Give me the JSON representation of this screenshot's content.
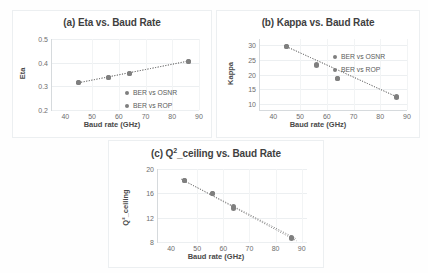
{
  "figure": {
    "background": "#ffffff",
    "marker_color": "#7f7f7f",
    "grid_color": "#eceff1",
    "axis_color": "#d6dadd"
  },
  "legend": {
    "series1": "BER vs OSNR",
    "series2": "BER vs ROP"
  },
  "chart_data": [
    {
      "type": "scatter",
      "panel": "a",
      "title": "(a) Eta vs. Baud Rate",
      "xlabel": "Baud rate (GHz)",
      "ylabel": "Eta",
      "xlim": [
        35,
        90
      ],
      "ylim": [
        0.2,
        0.5
      ],
      "xticks": [
        40,
        50,
        60,
        70,
        80,
        90
      ],
      "yticks": [
        0.2,
        0.3,
        0.4,
        0.5
      ],
      "ytick_labels": [
        "0.2",
        "0.3",
        "0.4",
        "0.5"
      ],
      "xtick_labels": [
        "40",
        "50",
        "60",
        "70",
        "80",
        "90"
      ],
      "grid": true,
      "legend_position": "lower-right",
      "x": [
        45,
        56,
        64,
        86
      ],
      "series": [
        {
          "name": "BER vs OSNR",
          "values": [
            0.315,
            0.337,
            0.355,
            0.405
          ]
        },
        {
          "name": "BER vs ROP",
          "values": [
            0.315,
            0.337,
            0.355,
            0.405
          ]
        }
      ],
      "trendlines": [
        {
          "name": "BER vs OSNR",
          "x0": 44,
          "y0": 0.313,
          "x1": 87,
          "y1": 0.409
        },
        {
          "name": "BER vs ROP",
          "x0": 44,
          "y0": 0.313,
          "x1": 87,
          "y1": 0.409
        }
      ]
    },
    {
      "type": "scatter",
      "panel": "b",
      "title": "(b) Kappa vs. Baud Rate",
      "xlabel": "Baud rate (GHz)",
      "ylabel": "Kappa",
      "xlim": [
        35,
        90
      ],
      "ylim": [
        8,
        32
      ],
      "xticks": [
        40,
        50,
        60,
        70,
        80,
        90
      ],
      "yticks": [
        10,
        15,
        20,
        25,
        30
      ],
      "ytick_labels": [
        "10",
        "15",
        "20",
        "25",
        "30"
      ],
      "xtick_labels": [
        "40",
        "50",
        "60",
        "70",
        "80",
        "90"
      ],
      "grid": true,
      "legend_position": "upper-right",
      "x": [
        45,
        56,
        64,
        86
      ],
      "series": [
        {
          "name": "BER vs OSNR",
          "values": [
            29.6,
            23.3,
            18.8,
            12.4
          ]
        },
        {
          "name": "BER vs ROP",
          "values": [
            29.6,
            23.2,
            18.8,
            12.3
          ]
        }
      ],
      "trendlines": [
        {
          "name": "BER vs OSNR",
          "x0": 44,
          "y0": 29.8,
          "x1": 87,
          "y1": 12.1
        },
        {
          "name": "BER vs ROP",
          "x0": 44,
          "y0": 29.8,
          "x1": 87,
          "y1": 12.1
        }
      ]
    },
    {
      "type": "scatter",
      "panel": "c",
      "title": "(c) Q²_ceiling vs. Baud Rate",
      "title_base": "(c) Q",
      "title_sup": "2",
      "title_rest": "_ceiling vs. Baud Rate",
      "xlabel": "Baud rate (GHz)",
      "ylabel": "Q²_ceiling",
      "xlim": [
        35,
        92
      ],
      "ylim": [
        8,
        20
      ],
      "xticks": [
        40,
        50,
        60,
        70,
        80,
        90
      ],
      "yticks": [
        8,
        12,
        16,
        20
      ],
      "ytick_labels": [
        "8",
        "12",
        "16",
        "20"
      ],
      "xtick_labels": [
        "40",
        "50",
        "60",
        "70",
        "80",
        "90"
      ],
      "grid": true,
      "legend_position": "upper-right",
      "x": [
        45,
        56,
        64,
        86
      ],
      "series": [
        {
          "name": "BER vs OSNR",
          "values": [
            18.1,
            15.9,
            13.8,
            8.7
          ]
        },
        {
          "name": "BER vs ROP",
          "values": [
            18.1,
            15.9,
            13.5,
            8.5
          ]
        }
      ],
      "trendlines": [
        {
          "name": "BER vs OSNR",
          "x0": 44,
          "y0": 18.3,
          "x1": 88,
          "y1": 8.5
        },
        {
          "name": "BER vs ROP",
          "x0": 44,
          "y0": 18.3,
          "x1": 88,
          "y1": 8.2
        }
      ]
    }
  ]
}
